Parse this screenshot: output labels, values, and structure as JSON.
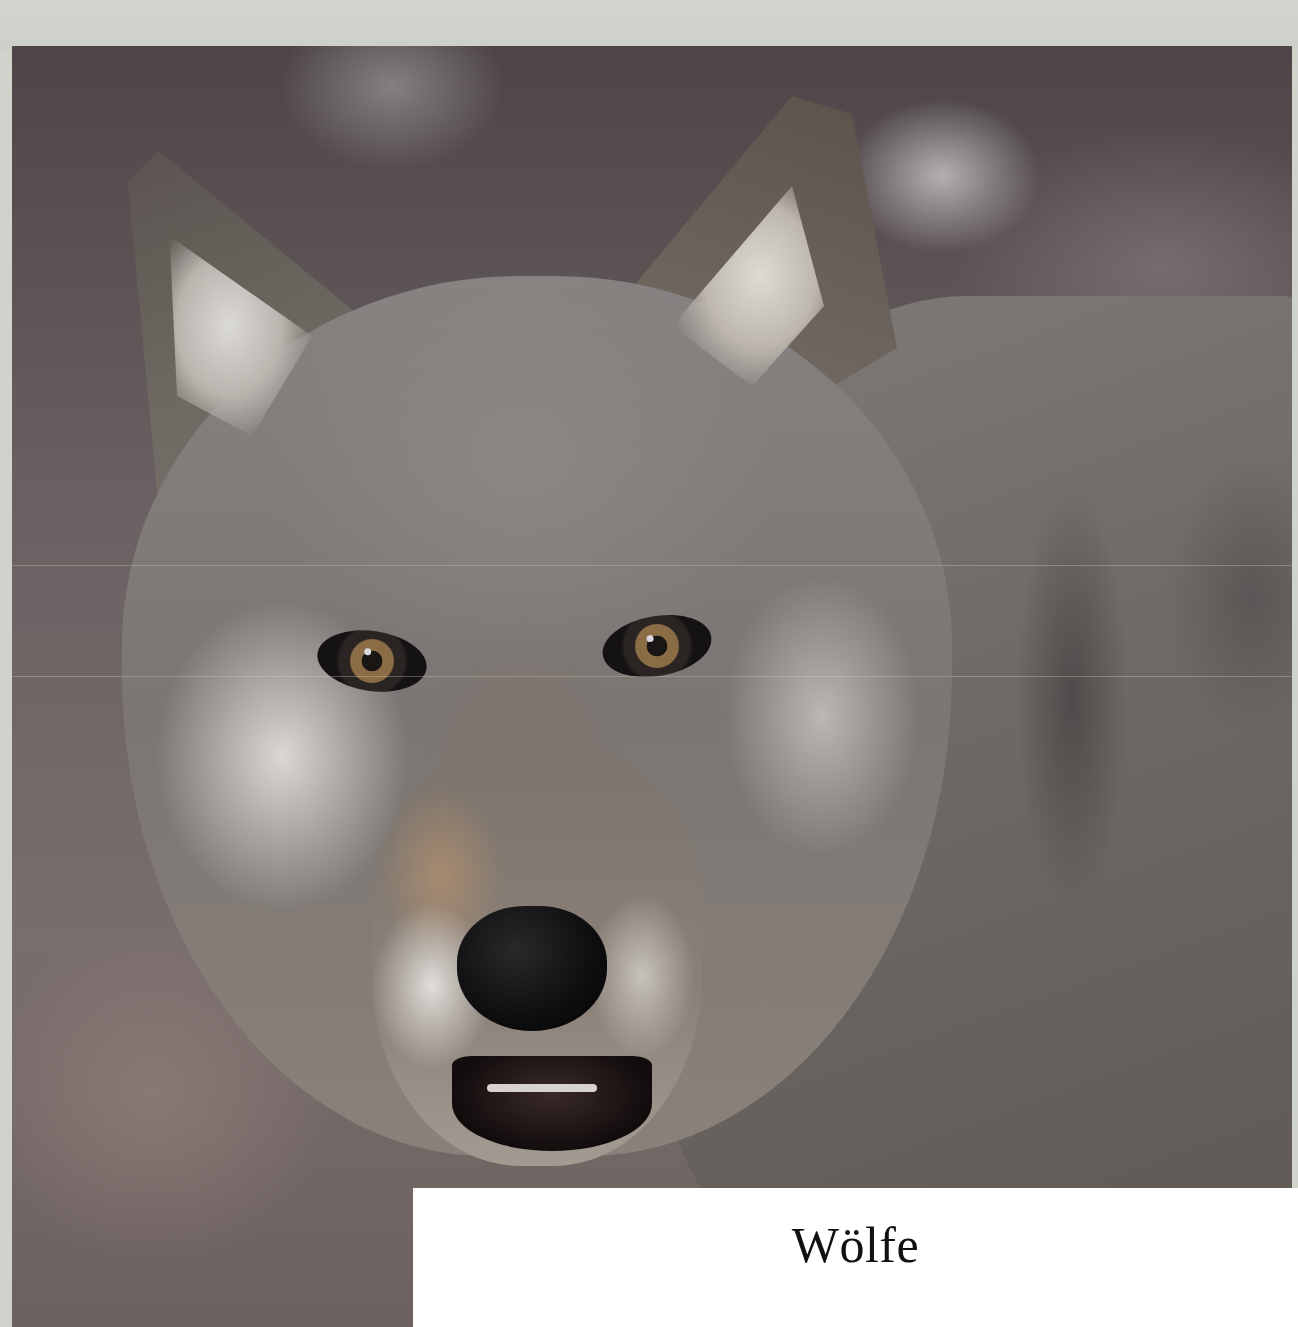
{
  "cover": {
    "title": "Wölfe",
    "image": {
      "subject": "wolf-portrait",
      "description": "Close-up photograph of a grey wolf facing the camera"
    },
    "colors": {
      "background": "#cfd3cc",
      "title_box": "#ffffff",
      "title_text": "#111111"
    }
  }
}
